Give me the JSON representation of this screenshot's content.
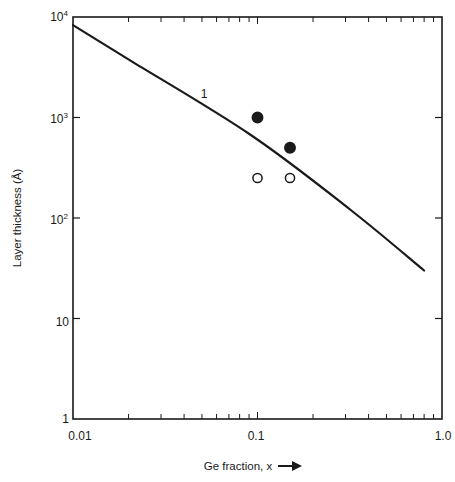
{
  "chart_data": {
    "type": "line",
    "title": "",
    "xlabel": "Ge fraction, x",
    "ylabel": "Layer thickness (Å)",
    "xscale": "log",
    "yscale": "log",
    "xlim": [
      0.01,
      1.0
    ],
    "ylim": [
      1,
      10000
    ],
    "grid": false,
    "x_ticks": [
      {
        "value": 0.01,
        "label": "0.01"
      },
      {
        "value": 0.1,
        "label": "0.1"
      },
      {
        "value": 1.0,
        "label": "1.0"
      }
    ],
    "y_ticks": [
      {
        "value": 1,
        "label": "1",
        "base": "1",
        "exp": ""
      },
      {
        "value": 10,
        "label": "10",
        "base": "10",
        "exp": ""
      },
      {
        "value": 100,
        "label": "10^2",
        "base": "10",
        "exp": "2"
      },
      {
        "value": 1000,
        "label": "10^3",
        "base": "10",
        "exp": "3"
      },
      {
        "value": 10000,
        "label": "10^4",
        "base": "10",
        "exp": "4"
      }
    ],
    "series": [
      {
        "name": "1",
        "kind": "line",
        "annotation": "1",
        "x": [
          0.01,
          0.0204,
          0.092,
          0.32,
          0.8
        ],
        "y": [
          8300,
          3700,
          670,
          120,
          30
        ]
      },
      {
        "name": "filled circles",
        "kind": "scatter",
        "marker": "filled-circle",
        "x": [
          0.1,
          0.15
        ],
        "y": [
          1000,
          500
        ]
      },
      {
        "name": "open circles",
        "kind": "scatter",
        "marker": "open-circle",
        "x": [
          0.1,
          0.15
        ],
        "y": [
          250,
          250
        ]
      }
    ],
    "legend": null,
    "axis_arrow": "→"
  },
  "labels": {
    "xlabel": "Ge fraction, x",
    "ylabel": "Layer thickness (Å)",
    "curve_label": "1",
    "x_tick_0": "0.01",
    "x_tick_1": "0.1",
    "x_tick_2": "1.0",
    "y_tick_1": "1",
    "y_tick_10": "10",
    "y_tick_100_base": "10",
    "y_tick_100_exp": "2",
    "y_tick_1000_base": "10",
    "y_tick_1000_exp": "3",
    "y_tick_10000_base": "10",
    "y_tick_10000_exp": "4"
  },
  "colors": {
    "ink": "#1a1a1a",
    "background": "#ffffff"
  }
}
